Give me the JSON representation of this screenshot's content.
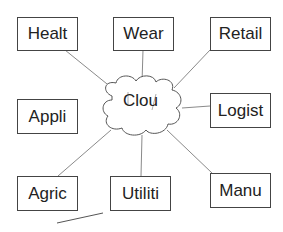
{
  "diagram": {
    "center": {
      "label": "Clou",
      "shape": "cloud"
    },
    "nodes": [
      {
        "id": "healt",
        "label": "Healt"
      },
      {
        "id": "wear",
        "label": "Wear"
      },
      {
        "id": "retail",
        "label": "Retail"
      },
      {
        "id": "appli",
        "label": "Appli"
      },
      {
        "id": "logist",
        "label": "Logist"
      },
      {
        "id": "agric",
        "label": "Agric"
      },
      {
        "id": "utiliti",
        "label": "Utiliti"
      },
      {
        "id": "manu",
        "label": "Manu"
      }
    ],
    "colors": {
      "line": "#888888",
      "border": "#444444",
      "text": "#222222"
    }
  }
}
